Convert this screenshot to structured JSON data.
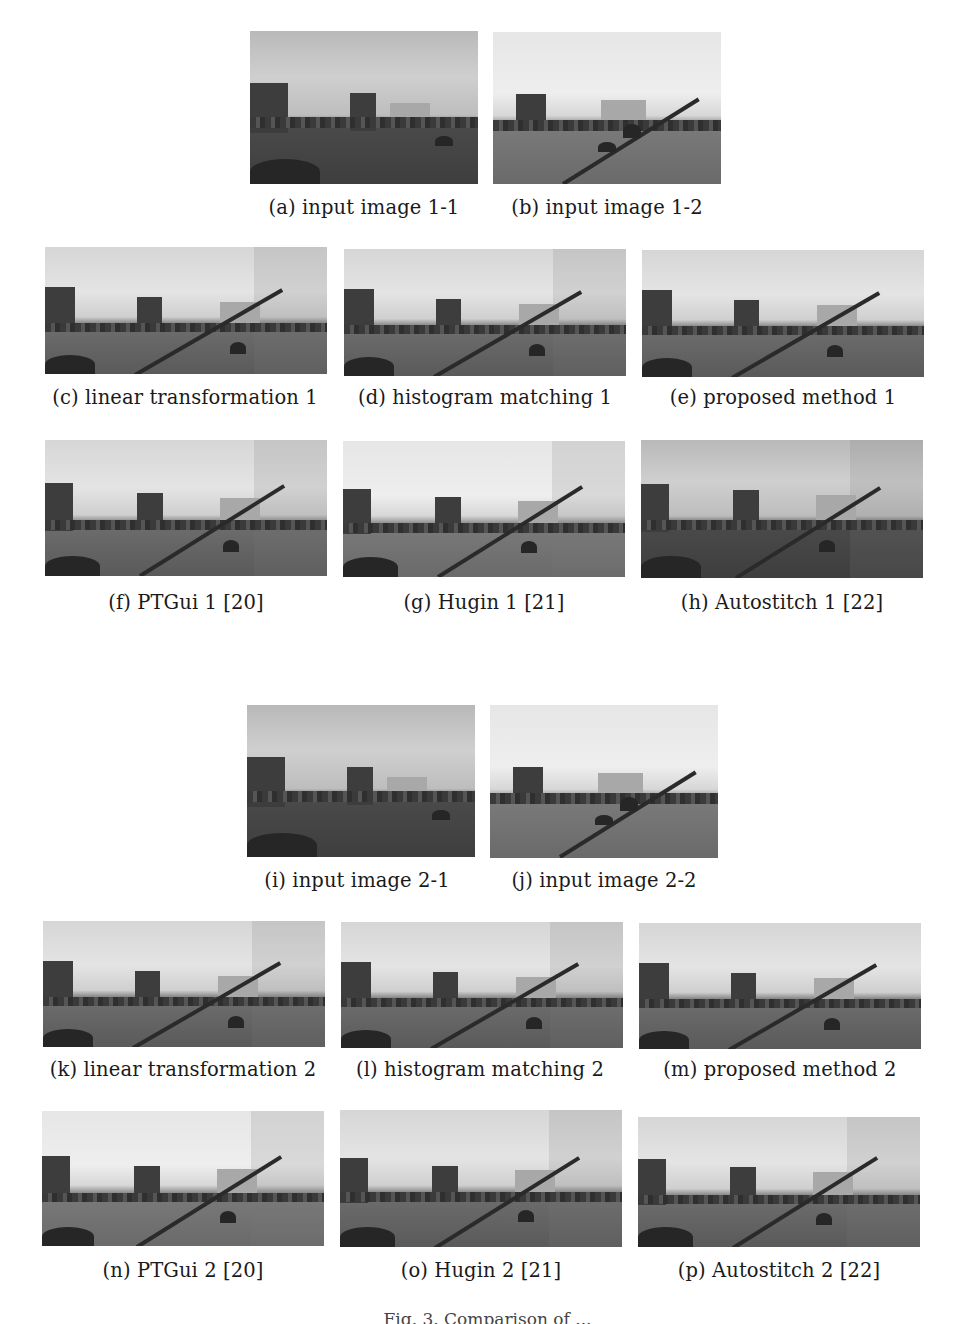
{
  "figure": {
    "groups": [
      {
        "name": "set-1",
        "inputs": [
          {
            "id": "a",
            "caption": "(a) input image 1-1",
            "tone": "dark"
          },
          {
            "id": "b",
            "caption": "(b) input image 1-2",
            "tone": "light"
          }
        ],
        "row1": [
          {
            "id": "c",
            "caption": "(c) linear transformation 1",
            "tone": "normal"
          },
          {
            "id": "d",
            "caption": "(d) histogram matching 1",
            "tone": "normal"
          },
          {
            "id": "e",
            "caption": "(e) proposed method 1",
            "tone": "normal"
          }
        ],
        "row2": [
          {
            "id": "f",
            "caption": "(f) PTGui 1 [20]",
            "tone": "normal"
          },
          {
            "id": "g",
            "caption": "(g) Hugin 1 [21]",
            "tone": "light"
          },
          {
            "id": "h",
            "caption": "(h) Autostitch 1 [22]",
            "tone": "dark"
          }
        ]
      },
      {
        "name": "set-2",
        "inputs": [
          {
            "id": "i",
            "caption": "(i) input image 2-1",
            "tone": "dark"
          },
          {
            "id": "j",
            "caption": "(j) input image 2-2",
            "tone": "light"
          }
        ],
        "row1": [
          {
            "id": "k",
            "caption": "(k) linear transformation 2",
            "tone": "normal"
          },
          {
            "id": "l",
            "caption": "(l) histogram matching 2",
            "tone": "normal"
          },
          {
            "id": "m",
            "caption": "(m) proposed method 2",
            "tone": "normal"
          }
        ],
        "row2": [
          {
            "id": "n",
            "caption": "(n) PTGui 2 [20]",
            "tone": "light"
          },
          {
            "id": "o",
            "caption": "(o) Hugin 2 [21]",
            "tone": "normal"
          },
          {
            "id": "p",
            "caption": "(p) Autostitch 2 [22]",
            "tone": "dark"
          }
        ]
      }
    ],
    "caption": "Fig. 3. Comparison of ..."
  }
}
